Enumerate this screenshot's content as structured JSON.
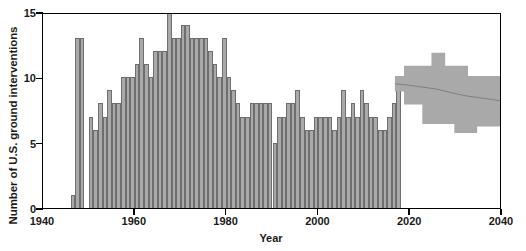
{
  "chart_data": {
    "type": "bar",
    "title": "",
    "xlabel": "Year",
    "ylabel": "Number of U.S. ground interventions",
    "xlim": [
      1940,
      2040
    ],
    "ylim": [
      0,
      15
    ],
    "xticks": [
      1940,
      1960,
      1980,
      2000,
      2020,
      2040
    ],
    "yticks": [
      0,
      5,
      10,
      15
    ],
    "grid": false,
    "legend": null,
    "bar_color": "#a9a9a9",
    "bar_edge_color": "#6e6e6e",
    "band_color": "#a9a9a9",
    "axis_color": "#000000",
    "x": [
      1946,
      1947,
      1948,
      1949,
      1950,
      1951,
      1952,
      1953,
      1954,
      1955,
      1956,
      1957,
      1958,
      1959,
      1960,
      1961,
      1962,
      1963,
      1964,
      1965,
      1966,
      1967,
      1968,
      1969,
      1970,
      1971,
      1972,
      1973,
      1974,
      1975,
      1976,
      1977,
      1978,
      1979,
      1980,
      1981,
      1982,
      1983,
      1984,
      1985,
      1986,
      1987,
      1988,
      1989,
      1990,
      1991,
      1992,
      1993,
      1994,
      1995,
      1996,
      1997,
      1998,
      1999,
      2000,
      2001,
      2002,
      2003,
      2004,
      2005,
      2006,
      2007,
      2008,
      2009,
      2010,
      2011,
      2012,
      2013,
      2014,
      2015,
      2016,
      2017
    ],
    "values": [
      1,
      13,
      13,
      0,
      7,
      6,
      8,
      7,
      9,
      8,
      8,
      10,
      10,
      10,
      11,
      13,
      11,
      10,
      12,
      12,
      12,
      15,
      13,
      13,
      14,
      14,
      13,
      13,
      13,
      13,
      12,
      11,
      10,
      13,
      10,
      9,
      8,
      7,
      7,
      8,
      8,
      8,
      8,
      8,
      5,
      7,
      7,
      8,
      8,
      9,
      7,
      6,
      6,
      7,
      7,
      7,
      7,
      6,
      7,
      9,
      7,
      8,
      7,
      9,
      8,
      7,
      7,
      6,
      6,
      7,
      8,
      9
    ],
    "forecast": {
      "start_year": 2017,
      "end_year": 2040,
      "line_x": [
        2017,
        2020,
        2026,
        2032,
        2040
      ],
      "line_y": [
        9.6,
        9.5,
        9.2,
        8.7,
        8.3
      ],
      "upper_x": [
        2017,
        2019,
        2019,
        2025,
        2025,
        2028,
        2028,
        2033,
        2033,
        2040
      ],
      "upper_y": [
        10.2,
        10.2,
        11.0,
        11.0,
        12.0,
        12.0,
        11.0,
        11.0,
        10.2,
        10.2
      ],
      "lower_x": [
        2017,
        2019,
        2019,
        2023,
        2023,
        2030,
        2030,
        2035,
        2035,
        2040
      ],
      "lower_y": [
        9.0,
        9.0,
        8.0,
        8.0,
        6.5,
        6.5,
        5.8,
        5.8,
        6.3,
        6.3
      ]
    }
  },
  "axes": {
    "ytick_labels": [
      "0",
      "5",
      "10",
      "15"
    ],
    "xtick_labels": [
      "1940",
      "1960",
      "1980",
      "2000",
      "2020",
      "2040"
    ]
  }
}
